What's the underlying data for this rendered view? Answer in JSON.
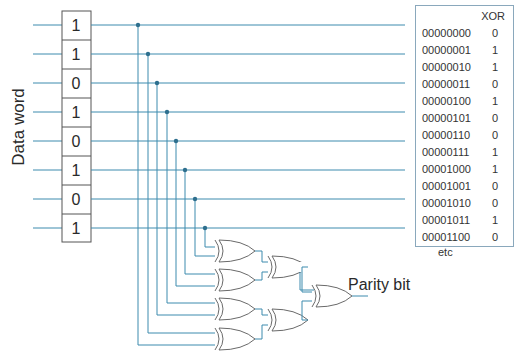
{
  "diagram": {
    "axis_label": "Data word",
    "data_word_bits": [
      "1",
      "1",
      "0",
      "1",
      "0",
      "1",
      "0",
      "1"
    ],
    "output_label": "Parity bit",
    "gate_type": "XOR",
    "gate_levels": [
      4,
      2,
      1
    ],
    "colors": {
      "wire": "#3d8bae",
      "gate_stroke": "#6a6a6a",
      "text": "#2a2a2a",
      "table_border": "#8aa8bc"
    }
  },
  "table": {
    "header": "XOR",
    "rows": [
      {
        "bits": "00000000",
        "xor": "0"
      },
      {
        "bits": "00000001",
        "xor": "1"
      },
      {
        "bits": "00000010",
        "xor": "1"
      },
      {
        "bits": "00000011",
        "xor": "0"
      },
      {
        "bits": "00000100",
        "xor": "1"
      },
      {
        "bits": "00000101",
        "xor": "0"
      },
      {
        "bits": "00000110",
        "xor": "0"
      },
      {
        "bits": "00000111",
        "xor": "1"
      },
      {
        "bits": "00001000",
        "xor": "1"
      },
      {
        "bits": "00001001",
        "xor": "0"
      },
      {
        "bits": "00001010",
        "xor": "0"
      },
      {
        "bits": "00001011",
        "xor": "1"
      },
      {
        "bits": "00001100",
        "xor": "0"
      }
    ],
    "footer": "etc"
  }
}
